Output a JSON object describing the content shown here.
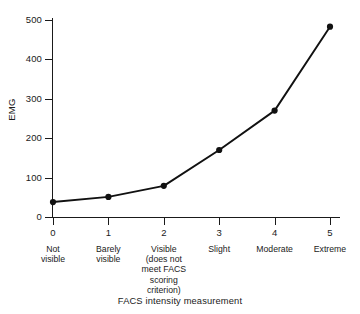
{
  "chart_data": {
    "type": "line",
    "title": "",
    "xlabel": "FACS intensity measurement",
    "ylabel": "EMG",
    "x": [
      0,
      1,
      2,
      3,
      4,
      5
    ],
    "categories": [
      "0",
      "1",
      "2",
      "3",
      "4",
      "5"
    ],
    "category_descriptions": [
      "Not\nvisible",
      "Barely\nvisible",
      "Visible\n(does not\nmeet FACS\nscoring\ncriterion)",
      "Slight",
      "Moderate",
      "Extreme"
    ],
    "values": [
      38,
      51,
      79,
      170,
      270,
      483
    ],
    "series": [
      {
        "name": "EMG",
        "values": [
          38,
          51,
          79,
          170,
          270,
          483
        ]
      }
    ],
    "ylim": [
      0,
      500
    ],
    "xlim": [
      0,
      5
    ],
    "ytick_labels": [
      "0",
      "100",
      "200",
      "300",
      "400",
      "500"
    ],
    "ytick_values": [
      0,
      100,
      200,
      300,
      400,
      500
    ],
    "xtick_labels": [
      "0",
      "1",
      "2",
      "3",
      "4",
      "5"
    ],
    "grid": false,
    "legend": false,
    "legend_position": "none",
    "marker": "filled-circle",
    "line_color": "#111111",
    "marker_color": "#111111",
    "background_color": "#ffffff",
    "axis_color": "#1a1a1a"
  },
  "axis": {
    "y_title": "EMG",
    "x_title": "FACS intensity measurement"
  }
}
